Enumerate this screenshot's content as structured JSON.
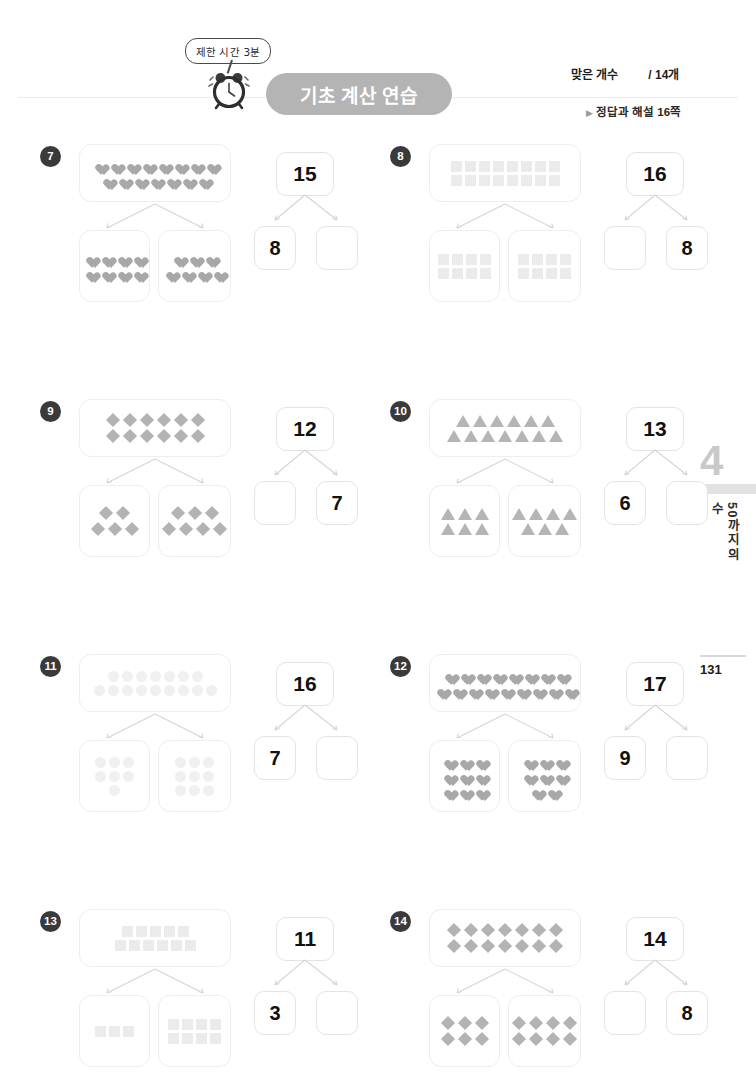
{
  "header": {
    "speech_bubble": "제한 시간 3분",
    "clock_icon": "alarm-clock-icon",
    "title": "기초 계산 연습",
    "score_label": "맞은 개수",
    "score_total": "/ 14개",
    "answer_ref_marker": "▶",
    "answer_ref": "정답과 해설 16쪽"
  },
  "side_tab": {
    "chapter_number": "4",
    "chapter_title": "50까지의 수"
  },
  "page_number": "131",
  "colors": {
    "title_pill": "#b4b4b4",
    "badge": "#3a3a3a",
    "box_border": "#eeeeee",
    "number_box_border": "#e4e4e4",
    "connector": "#d5d5d5"
  },
  "problems": [
    {
      "number": "7",
      "shape": "heart",
      "faded": false,
      "top_rows": [
        8,
        7
      ],
      "left_rows": [
        4,
        4
      ],
      "right_rows": [
        3,
        4
      ],
      "total": "15",
      "left_value": "8",
      "right_value": ""
    },
    {
      "number": "8",
      "shape": "square",
      "faded": true,
      "top_rows": [
        8,
        8
      ],
      "left_rows": [
        4,
        4
      ],
      "right_rows": [
        4,
        4
      ],
      "total": "16",
      "left_value": "",
      "right_value": "8"
    },
    {
      "number": "9",
      "shape": "diamond",
      "faded": false,
      "top_rows": [
        6,
        6
      ],
      "left_rows": [
        2,
        3
      ],
      "right_rows": [
        3,
        4
      ],
      "total": "12",
      "left_value": "",
      "right_value": "7"
    },
    {
      "number": "10",
      "shape": "triangle",
      "faded": false,
      "top_rows": [
        6,
        7
      ],
      "left_rows": [
        3,
        3
      ],
      "right_rows": [
        4,
        3
      ],
      "total": "13",
      "left_value": "6",
      "right_value": ""
    },
    {
      "number": "11",
      "shape": "circle",
      "faded": true,
      "top_rows": [
        7,
        9
      ],
      "left_rows": [
        3,
        3,
        1
      ],
      "right_rows": [
        3,
        3,
        3
      ],
      "total": "16",
      "left_value": "7",
      "right_value": ""
    },
    {
      "number": "12",
      "shape": "heart",
      "faded": false,
      "top_rows": [
        8,
        9
      ],
      "left_rows": [
        3,
        3,
        3
      ],
      "right_rows": [
        3,
        3,
        2
      ],
      "total": "17",
      "left_value": "9",
      "right_value": ""
    },
    {
      "number": "13",
      "shape": "square",
      "faded": true,
      "top_rows": [
        5,
        6
      ],
      "left_rows": [
        3
      ],
      "right_rows": [
        4,
        4
      ],
      "total": "11",
      "left_value": "3",
      "right_value": ""
    },
    {
      "number": "14",
      "shape": "diamond",
      "faded": false,
      "top_rows": [
        7,
        7
      ],
      "left_rows": [
        3,
        3
      ],
      "right_rows": [
        4,
        4
      ],
      "total": "14",
      "left_value": "",
      "right_value": "8"
    }
  ]
}
